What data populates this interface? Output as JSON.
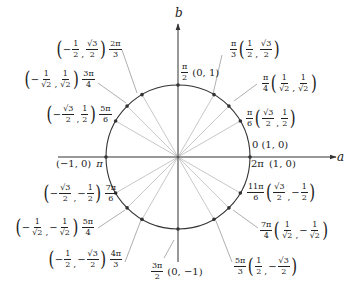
{
  "diagram": {
    "center": [
      178,
      157
    ],
    "radius": 72,
    "axes": {
      "horizontal_label": "a",
      "vertical_label": "b",
      "h_start_x": 58,
      "h_end_x": 336,
      "v_start_y": 262,
      "v_end_y": 24
    },
    "colors": {
      "circle": "#333333",
      "axis": "#333333",
      "ray": "#c8c8c8",
      "leader": "#9a9a9a",
      "point": "#333333",
      "text": "#222222"
    }
  },
  "points": [
    {
      "angle_deg": 0,
      "angle_label": "0",
      "coord": "(1, 0)"
    },
    {
      "angle_deg": 30,
      "angle_label": "π/6",
      "coord": "(√3/2, 1/2)"
    },
    {
      "angle_deg": 45,
      "angle_label": "π/4",
      "coord": "(1/√2, 1/√2)"
    },
    {
      "angle_deg": 60,
      "angle_label": "π/3",
      "coord": "(1/2, √3/2)"
    },
    {
      "angle_deg": 90,
      "angle_label": "π/2",
      "coord": "(0, 1)"
    },
    {
      "angle_deg": 120,
      "angle_label": "2π/3",
      "coord": "(−1/2, √3/2)"
    },
    {
      "angle_deg": 135,
      "angle_label": "3π/4",
      "coord": "(−1/√2, 1/√2)"
    },
    {
      "angle_deg": 150,
      "angle_label": "5π/6",
      "coord": "(−√3/2, 1/2)"
    },
    {
      "angle_deg": 180,
      "angle_label": "π",
      "coord": "(−1, 0)"
    },
    {
      "angle_deg": 210,
      "angle_label": "7π/6",
      "coord": "(−√3/2, −1/2)"
    },
    {
      "angle_deg": 225,
      "angle_label": "5π/4",
      "coord": "(−1/√2, −1/√2)"
    },
    {
      "angle_deg": 240,
      "angle_label": "4π/3",
      "coord": "(−1/2, −√3/2)"
    },
    {
      "angle_deg": 270,
      "angle_label": "3π/2",
      "coord": "(0, −1)"
    },
    {
      "angle_deg": 300,
      "angle_label": "5π/3",
      "coord": "(1/2, −√3/2)"
    },
    {
      "angle_deg": 315,
      "angle_label": "7π/4",
      "coord": "(1/√2, −1/√2)"
    },
    {
      "angle_deg": 330,
      "angle_label": "11π/6",
      "coord": "(√3/2, −1/2)"
    },
    {
      "angle_deg": 360,
      "angle_label": "2π",
      "coord": "(1, 0)"
    }
  ],
  "labels": {
    "zero": {
      "angle": "0",
      "coord": "(1, 0)"
    },
    "two_pi": {
      "angle": "2π",
      "coord": "(1, 0)"
    },
    "pi_6": {
      "num": "π",
      "den": "6",
      "x_num": "√3",
      "x_den": "2",
      "y_num": "1",
      "y_den": "2"
    },
    "pi_4": {
      "num": "π",
      "den": "4",
      "x_num": "1",
      "x_den": "√2",
      "y_num": "1",
      "y_den": "√2"
    },
    "pi_3": {
      "num": "π",
      "den": "3",
      "x_num": "1",
      "x_den": "2",
      "y_num": "√3",
      "y_den": "2"
    },
    "pi_2": {
      "num": "π",
      "den": "2",
      "coord": "(0, 1)"
    },
    "two_pi_3": {
      "num": "2π",
      "den": "3",
      "x_sign": "−",
      "x_num": "1",
      "x_den": "2",
      "y_num": "√3",
      "y_den": "2"
    },
    "three_pi_4": {
      "num": "3π",
      "den": "4",
      "x_sign": "−",
      "x_num": "1",
      "x_den": "√2",
      "y_num": "1",
      "y_den": "√2"
    },
    "five_pi_6": {
      "num": "5π",
      "den": "6",
      "x_sign": "−",
      "x_num": "√3",
      "x_den": "2",
      "y_num": "1",
      "y_den": "2"
    },
    "pi": {
      "angle": "π",
      "coord": "(−1, 0)"
    },
    "seven_pi_6": {
      "num": "7π",
      "den": "6",
      "x_sign": "−",
      "x_num": "√3",
      "x_den": "2",
      "y_sign": "−",
      "y_num": "1",
      "y_den": "2"
    },
    "five_pi_4": {
      "num": "5π",
      "den": "4",
      "x_sign": "−",
      "x_num": "1",
      "x_den": "√2",
      "y_sign": "−",
      "y_num": "1",
      "y_den": "√2"
    },
    "four_pi_3": {
      "num": "4π",
      "den": "3",
      "x_sign": "−",
      "x_num": "1",
      "x_den": "2",
      "y_sign": "−",
      "y_num": "√3",
      "y_den": "2"
    },
    "three_pi_2": {
      "num": "3π",
      "den": "2",
      "coord": "(0, −1)"
    },
    "five_pi_3": {
      "num": "5π",
      "den": "3",
      "x_num": "1",
      "x_den": "2",
      "y_sign": "−",
      "y_num": "√3",
      "y_den": "2"
    },
    "seven_pi_4": {
      "num": "7π",
      "den": "4",
      "x_num": "1",
      "x_den": "√2",
      "y_sign": "−",
      "y_num": "1",
      "y_den": "√2"
    },
    "eleven_pi_6": {
      "num": "11π",
      "den": "6",
      "x_num": "√3",
      "x_den": "2",
      "y_sign": "−",
      "y_num": "1",
      "y_den": "2"
    }
  }
}
